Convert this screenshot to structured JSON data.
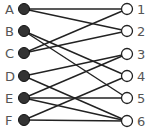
{
  "diagram": {
    "type": "bipartite-graph",
    "left_nodes": [
      {
        "id": "A",
        "label": "A",
        "x": 24,
        "y": 9
      },
      {
        "id": "B",
        "label": "B",
        "x": 24,
        "y": 31
      },
      {
        "id": "C",
        "label": "C",
        "x": 24,
        "y": 53
      },
      {
        "id": "D",
        "label": "D",
        "x": 24,
        "y": 76
      },
      {
        "id": "E",
        "label": "E",
        "x": 24,
        "y": 98
      },
      {
        "id": "F",
        "label": "F",
        "x": 24,
        "y": 120
      }
    ],
    "right_nodes": [
      {
        "id": "1",
        "label": "1",
        "x": 127,
        "y": 9
      },
      {
        "id": "2",
        "label": "2",
        "x": 127,
        "y": 31
      },
      {
        "id": "3",
        "label": "3",
        "x": 127,
        "y": 54
      },
      {
        "id": "4",
        "label": "4",
        "x": 127,
        "y": 76
      },
      {
        "id": "5",
        "label": "5",
        "x": 127,
        "y": 98
      },
      {
        "id": "6",
        "label": "6",
        "x": 127,
        "y": 121
      }
    ],
    "edges": [
      [
        "A",
        "1"
      ],
      [
        "A",
        "2"
      ],
      [
        "B",
        "4"
      ],
      [
        "B",
        "5"
      ],
      [
        "C",
        "1"
      ],
      [
        "C",
        "2"
      ],
      [
        "D",
        "3"
      ],
      [
        "D",
        "6"
      ],
      [
        "E",
        "3"
      ],
      [
        "E",
        "5"
      ],
      [
        "E",
        "6"
      ],
      [
        "F",
        "4"
      ],
      [
        "F",
        "6"
      ]
    ],
    "colors": {
      "left_fill": "#333333",
      "right_fill": "#ffffff",
      "stroke": "#222222",
      "label": "#555555"
    }
  }
}
